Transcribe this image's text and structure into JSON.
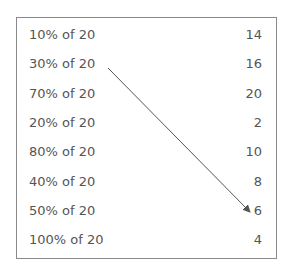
{
  "left_items": [
    "10% of 20",
    "30% of 20",
    "70% of 20",
    "20% of 20",
    "80% of 20",
    "40% of 20",
    "50% of 20",
    "100% of 20"
  ],
  "right_items": [
    "14",
    "16",
    "20",
    "2",
    "10",
    "8",
    "6",
    "4"
  ],
  "connections": [
    {
      "from": "30% of 20",
      "to": "6"
    }
  ]
}
